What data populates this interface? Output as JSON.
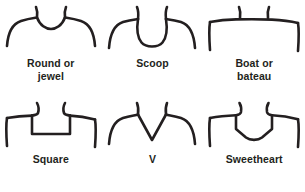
{
  "figure": {
    "stroke_color": "#231f20",
    "background_color": "#ffffff",
    "columns": 3,
    "rows": 2
  },
  "necklines": [
    {
      "id": "round-or-jewel",
      "label": "Round or\njewel",
      "icon": "round-neckline-icon",
      "description": "Shallow rounded neckline close to the base of the neck"
    },
    {
      "id": "scoop",
      "label": "Scoop",
      "icon": "scoop-neckline-icon",
      "description": "Deep U-shaped neckline"
    },
    {
      "id": "boat-or-bateau",
      "label": "Boat or\nbateau",
      "icon": "boat-neckline-icon",
      "description": "Wide shallow neckline reaching shoulder to shoulder"
    },
    {
      "id": "square",
      "label": "Square",
      "icon": "square-neckline-icon",
      "description": "Rectangular neckline with straight bottom edge"
    },
    {
      "id": "v",
      "label": "V",
      "icon": "v-neckline-icon",
      "description": "Deep V-shaped neckline meeting at a point"
    },
    {
      "id": "sweetheart",
      "label": "Sweetheart",
      "icon": "sweetheart-neckline-icon",
      "description": "Squared sides with a soft heart-shaped dip at center"
    }
  ]
}
